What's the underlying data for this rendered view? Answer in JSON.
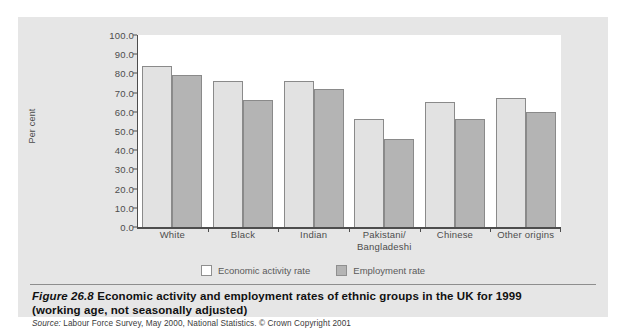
{
  "figure": {
    "number_label": "Figure 26.8",
    "title": "Economic activity and employment rates of ethnic groups in the UK for 1999 (working age, not seasonally adjusted)",
    "title_line1": "Economic activity and employment rates of ethnic groups in the UK for 1999",
    "title_line2": "(working age, not seasonally adjusted)",
    "source_label": "Source:",
    "source_text": "Labour Force Survey, May 2000, National Statistics. © Crown Copyright 2001"
  },
  "colors": {
    "panel_background": "#e6e6e6",
    "plot_background": "#ffffff",
    "axis": "#4d4d4d",
    "series_economic_activity": "#e2e2e2",
    "series_employment": "#b4b4b4",
    "bar_outline": "#8a8a8a"
  },
  "chart_data": {
    "type": "bar",
    "title": "Economic activity and employment rates of ethnic groups in the UK for 1999",
    "xlabel": "",
    "ylabel": "Per cent",
    "ylim": [
      0.0,
      100.0
    ],
    "ytick_step": 10.0,
    "ytick_labels": [
      "100.0",
      "90.0",
      "80.0",
      "70.0",
      "60.0",
      "50.0",
      "40.0",
      "30.0",
      "20.0",
      "10.0",
      "0.0"
    ],
    "ytick_values": [
      100.0,
      90.0,
      80.0,
      70.0,
      60.0,
      50.0,
      40.0,
      30.0,
      20.0,
      10.0,
      0.0
    ],
    "grid": false,
    "legend_position": "bottom-center",
    "categories": [
      "White",
      "Black",
      "Indian",
      "Pakistani/ Bangladeshi",
      "Chinese",
      "Other origins"
    ],
    "category_lines": [
      [
        "White"
      ],
      [
        "Black"
      ],
      [
        "Indian"
      ],
      [
        "Pakistani/",
        "Bangladeshi"
      ],
      [
        "Chinese"
      ],
      [
        "Other origins"
      ]
    ],
    "series": [
      {
        "name": "Economic activity rate",
        "color": "#e2e2e2",
        "values": [
          84,
          76,
          76,
          56,
          65,
          67
        ]
      },
      {
        "name": "Employment rate",
        "color": "#b4b4b4",
        "values": [
          79,
          66,
          72,
          46,
          56,
          60
        ]
      }
    ]
  }
}
